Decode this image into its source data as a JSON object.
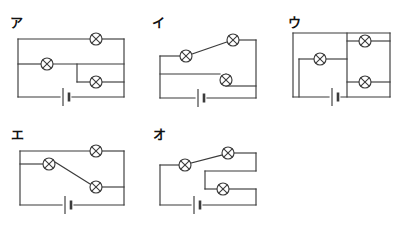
{
  "page": {
    "background_color": "#ffffff",
    "line_color": "#3b3b3b",
    "text_color": "#111111",
    "width": 400,
    "height": 234
  },
  "symbols": {
    "lamp": {
      "name": "lamp-symbol",
      "description": "circle with an X inside",
      "radius": 6
    },
    "battery": {
      "name": "battery-symbol",
      "description": "one long thin plate and one short thick plate"
    }
  },
  "circuits": [
    {
      "id": "a",
      "label": "ア",
      "label_x": 10,
      "label_y": 16,
      "lamp_count": 3,
      "battery_count": 1,
      "lamps": [
        {
          "name": "lamp-a-top",
          "x": 96,
          "y": 39
        },
        {
          "name": "lamp-a-middle",
          "x": 47,
          "y": 64
        },
        {
          "name": "lamp-a-lower",
          "x": 96,
          "y": 82
        }
      ],
      "batteries": [
        {
          "name": "battery-a",
          "x": 66,
          "y": 97
        }
      ],
      "wires": [
        "M18,39 L90,39",
        "M102,39 L124,39",
        "M18,39 L18,97",
        "M124,39 L124,97",
        "M18,64 L41,64",
        "M53,64 L124,64",
        "M77,64 L77,82",
        "M77,82 L90,82",
        "M102,82 L124,82",
        "M18,97 L60,97",
        "M72,97 L124,97"
      ]
    },
    {
      "id": "i",
      "label": "イ",
      "label_x": 152,
      "label_y": 16,
      "lamp_count": 3,
      "battery_count": 1,
      "lamps": [
        {
          "name": "lamp-i-upper-right",
          "x": 233,
          "y": 40
        },
        {
          "name": "lamp-i-upper-left",
          "x": 186,
          "y": 56
        },
        {
          "name": "lamp-i-lower-right",
          "x": 226,
          "y": 80
        }
      ],
      "batteries": [
        {
          "name": "battery-i",
          "x": 201,
          "y": 98
        }
      ],
      "wires": [
        "M192,54 L227,42",
        "M239,40 L256,40",
        "M256,40 L256,98",
        "M160,56 L180,56",
        "M160,56 L160,98",
        "M160,74 L220,74",
        "M226,74 L226,86",
        "M226,86 L256,86",
        "M160,98 L195,98",
        "M207,98 L256,98"
      ]
    },
    {
      "id": "u",
      "label": "ウ",
      "label_x": 288,
      "label_y": 16,
      "lamp_count": 3,
      "battery_count": 1,
      "lamps": [
        {
          "name": "lamp-u-top-right",
          "x": 365,
          "y": 41
        },
        {
          "name": "lamp-u-left",
          "x": 320,
          "y": 59
        },
        {
          "name": "lamp-u-bottom-right",
          "x": 365,
          "y": 82
        }
      ],
      "batteries": [
        {
          "name": "battery-u",
          "x": 335,
          "y": 97
        }
      ],
      "wires": [
        "M293,33 L390,33",
        "M293,33 L293,97",
        "M390,33 L390,97",
        "M347,33 L347,97",
        "M347,41 L359,41",
        "M371,41 L390,41",
        "M347,82 L359,82",
        "M371,82 L390,82",
        "M299,59 L314,59",
        "M326,59 L347,59",
        "M299,59 L299,97",
        "M293,97 L329,97",
        "M341,97 L390,97"
      ]
    },
    {
      "id": "e",
      "label": "エ",
      "label_x": 11,
      "label_y": 128,
      "lamp_count": 3,
      "battery_count": 1,
      "lamps": [
        {
          "name": "lamp-e-top",
          "x": 96,
          "y": 151
        },
        {
          "name": "lamp-e-left",
          "x": 49,
          "y": 164
        },
        {
          "name": "lamp-e-right",
          "x": 96,
          "y": 187
        }
      ],
      "batteries": [
        {
          "name": "battery-e",
          "x": 68,
          "y": 205
        }
      ],
      "wires": [
        "M20,151 L90,151",
        "M102,151 L124,151",
        "M20,151 L20,205",
        "M124,151 L124,205",
        "M20,164 L43,164",
        "M55,162 L90,184",
        "M102,187 L124,187",
        "M20,205 L62,205",
        "M74,205 L124,205"
      ]
    },
    {
      "id": "o",
      "label": "オ",
      "label_x": 153,
      "label_y": 128,
      "lamp_count": 3,
      "battery_count": 1,
      "lamps": [
        {
          "name": "lamp-o-upper-right",
          "x": 228,
          "y": 153
        },
        {
          "name": "lamp-o-upper-left",
          "x": 185,
          "y": 165
        },
        {
          "name": "lamp-o-lower",
          "x": 223,
          "y": 189
        }
      ],
      "batteries": [
        {
          "name": "battery-o",
          "x": 197,
          "y": 205
        }
      ],
      "wires": [
        "M191,163 L222,155",
        "M234,153 L256,153",
        "M256,153 L256,171",
        "M256,171 L205,171",
        "M205,171 L205,189",
        "M205,189 L217,189",
        "M229,189 L256,189",
        "M256,189 L256,205",
        "M160,165 L179,165",
        "M160,165 L160,205",
        "M160,205 L191,205",
        "M203,205 L256,205"
      ]
    }
  ]
}
